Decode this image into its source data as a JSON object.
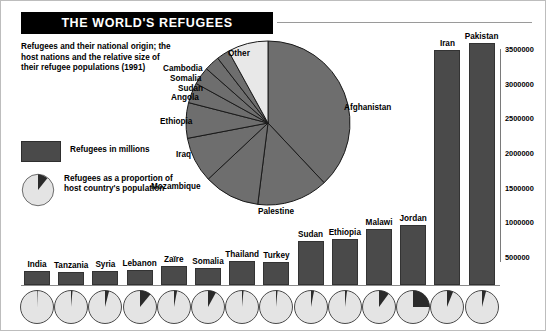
{
  "title": "THE WORLD'S REFUGEES",
  "caption": "Refugees and their national origin; the host nations and the relative size of their refugee populations (1991)",
  "legend": {
    "bar_label": "Refugees in millions",
    "pie_label": "Refugees as a proportion of host country's population"
  },
  "colors": {
    "bar_fill": "#4a4a4a",
    "pie_main": "#6e6e6e",
    "pie_other": "#e8e8e8",
    "mini_base": "#e4e4e4",
    "mini_slice": "#2b2b2b",
    "title_bg": "#000000"
  },
  "chart_data": [
    {
      "type": "pie",
      "title": "Refugees by national origin (1991)",
      "labels": [
        "Afghanistan",
        "Palestine",
        "Mozambique",
        "Iraq",
        "Ethiopia",
        "Angola",
        "Sudan",
        "Somalia",
        "Cambodia",
        "Other"
      ],
      "values": [
        38,
        14,
        11,
        9,
        7,
        4,
        3.5,
        3,
        2.5,
        8
      ],
      "unit": "percent of world refugees",
      "legend": "none"
    },
    {
      "type": "bar",
      "title": "Refugee population by host nation (1991)",
      "categories": [
        "India",
        "Tanzania",
        "Syria",
        "Lebanon",
        "Zaïre",
        "Somalia",
        "Thailand",
        "Turkey",
        "Sudan",
        "Ethiopia",
        "Malawi",
        "Jordan",
        "Iran",
        "Pakistan"
      ],
      "values": [
        310000,
        300000,
        310000,
        320000,
        380000,
        360000,
        450000,
        440000,
        740000,
        780000,
        920000,
        980000,
        3500000,
        3600000
      ],
      "xlabel": "",
      "ylabel": "",
      "ylim": [
        0,
        3800000
      ],
      "ticks": [
        "500000",
        "1000000",
        "1500000",
        "2000000",
        "2500000",
        "3000000",
        "3500000"
      ],
      "grid": false,
      "legend": "none"
    },
    {
      "type": "pie",
      "title": "Refugees as a proportion of host country's population",
      "categories": [
        "India",
        "Tanzania",
        "Syria",
        "Lebanon",
        "Zaïre",
        "Somalia",
        "Thailand",
        "Turkey",
        "Sudan",
        "Ethiopia",
        "Malawi",
        "Jordan",
        "Iran",
        "Pakistan"
      ],
      "values": [
        0.5,
        1.5,
        4,
        11,
        3,
        8,
        1.5,
        1.5,
        3,
        2,
        10,
        25,
        6,
        4
      ],
      "unit": "percent of host population"
    }
  ],
  "pie_labels": [
    {
      "name": "Afghanistan"
    },
    {
      "name": "Palestine"
    },
    {
      "name": "Mozambique"
    },
    {
      "name": "Iraq"
    },
    {
      "name": "Ethiopia"
    },
    {
      "name": "Angola"
    },
    {
      "name": "Sudan"
    },
    {
      "name": "Somalia"
    },
    {
      "name": "Cambodia"
    },
    {
      "name": "Other"
    }
  ]
}
